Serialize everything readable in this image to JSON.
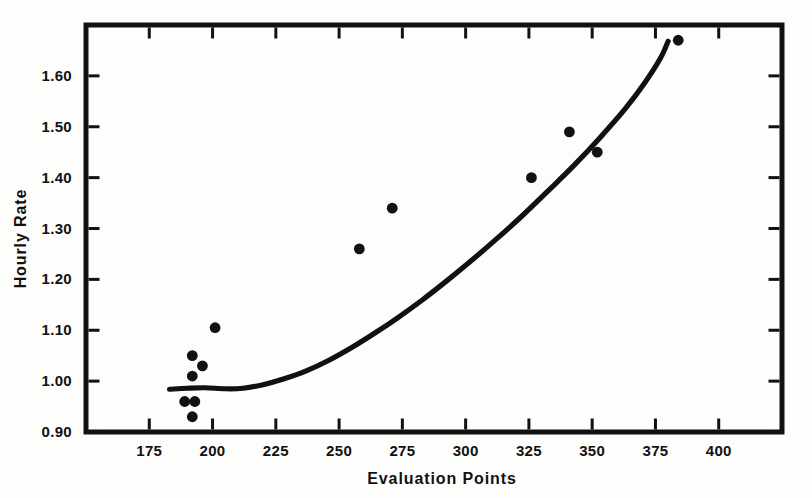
{
  "chart_data": {
    "type": "scatter",
    "title": "",
    "xlabel": "Evaluation Points",
    "ylabel": "Hourly Rate",
    "xlim": [
      150,
      425
    ],
    "ylim": [
      0.9,
      1.7
    ],
    "xticks": [
      175,
      200,
      225,
      250,
      275,
      300,
      325,
      350,
      375,
      400
    ],
    "xtick_labels": [
      "175",
      "200",
      "225",
      "250",
      "275",
      "300",
      "325",
      "350",
      "375",
      "400"
    ],
    "yticks": [
      0.9,
      1.0,
      1.1,
      1.2,
      1.3,
      1.4,
      1.5,
      1.6
    ],
    "ytick_labels": [
      "0.90",
      "1.00",
      "1.10",
      "1.20",
      "1.30",
      "1.40",
      "1.50",
      "1.60"
    ],
    "grid": false,
    "legend": null,
    "frame": "box",
    "tick_direction": "in",
    "ticks_all_sides": true,
    "marker": "filled-circle",
    "marker_color": "#111111",
    "line_color": "#111111",
    "series": [
      {
        "name": "Observations",
        "type": "scatter",
        "points": [
          {
            "x": 189,
            "y": 0.96
          },
          {
            "x": 192,
            "y": 0.93
          },
          {
            "x": 193,
            "y": 0.96
          },
          {
            "x": 192,
            "y": 1.01
          },
          {
            "x": 192,
            "y": 1.05
          },
          {
            "x": 196,
            "y": 1.03
          },
          {
            "x": 201,
            "y": 1.105
          },
          {
            "x": 258,
            "y": 1.26
          },
          {
            "x": 271,
            "y": 1.34
          },
          {
            "x": 326,
            "y": 1.4
          },
          {
            "x": 341,
            "y": 1.49
          },
          {
            "x": 352,
            "y": 1.45
          },
          {
            "x": 384,
            "y": 1.67
          }
        ]
      },
      {
        "name": "Fitted curve",
        "type": "line",
        "points": [
          {
            "x": 183,
            "y": 0.984
          },
          {
            "x": 190,
            "y": 0.986
          },
          {
            "x": 197,
            "y": 0.987
          },
          {
            "x": 205,
            "y": 0.985
          },
          {
            "x": 212,
            "y": 0.986
          },
          {
            "x": 220,
            "y": 0.993
          },
          {
            "x": 228,
            "y": 1.004
          },
          {
            "x": 237,
            "y": 1.02
          },
          {
            "x": 246,
            "y": 1.041
          },
          {
            "x": 255,
            "y": 1.066
          },
          {
            "x": 264,
            "y": 1.094
          },
          {
            "x": 273,
            "y": 1.124
          },
          {
            "x": 283,
            "y": 1.16
          },
          {
            "x": 293,
            "y": 1.199
          },
          {
            "x": 303,
            "y": 1.24
          },
          {
            "x": 313,
            "y": 1.283
          },
          {
            "x": 323,
            "y": 1.328
          },
          {
            "x": 333,
            "y": 1.376
          },
          {
            "x": 343,
            "y": 1.425
          },
          {
            "x": 353,
            "y": 1.478
          },
          {
            "x": 363,
            "y": 1.535
          },
          {
            "x": 371,
            "y": 1.588
          },
          {
            "x": 377,
            "y": 1.635
          },
          {
            "x": 380,
            "y": 1.668
          }
        ]
      }
    ]
  }
}
